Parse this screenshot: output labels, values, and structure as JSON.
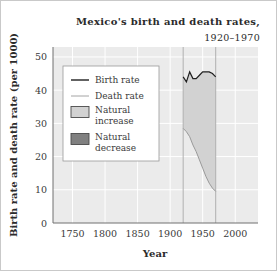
{
  "chart_data": {
    "type": "area",
    "title": "Mexico's birth and death rates,",
    "subtitle": "1920–1970",
    "xlabel": "Year",
    "ylabel": "Birth rate and death rate (per 1000)",
    "xlim": [
      1720,
      2035
    ],
    "ylim": [
      0,
      53
    ],
    "xticks": [
      1750,
      1800,
      1850,
      1900,
      1950,
      2000
    ],
    "yticks": [
      0,
      10,
      20,
      30,
      40,
      50
    ],
    "grid": "horizontal-and-vertical-light",
    "legend_position": "upper-left-inside",
    "legend": [
      {
        "label": "Birth rate",
        "marker": "line",
        "color": "#1f1f1f"
      },
      {
        "label": "Death rate",
        "marker": "line",
        "color": "#9a9a9a"
      },
      {
        "label": "Natural increase",
        "marker": "swatch",
        "color": "#d2d2d2"
      },
      {
        "label": "Natural decrease",
        "marker": "swatch",
        "color": "#808080"
      }
    ],
    "reference_lines": [
      {
        "x": 1920,
        "color": "#b0b0b0"
      },
      {
        "x": 1970,
        "color": "#b0b0b0"
      }
    ],
    "x": [
      1920,
      1925,
      1930,
      1935,
      1940,
      1945,
      1950,
      1955,
      1960,
      1965,
      1970
    ],
    "series": [
      {
        "name": "Birth rate",
        "color": "#1f1f1f",
        "values": [
          44.0,
          42.5,
          45.5,
          43.5,
          43.5,
          44.5,
          45.5,
          45.5,
          45.5,
          45.0,
          44.0
        ]
      },
      {
        "name": "Death rate",
        "color": "#9a9a9a",
        "values": [
          28.5,
          27.5,
          26.0,
          23.5,
          21.5,
          19.0,
          16.5,
          14.0,
          12.0,
          10.5,
          9.5
        ]
      }
    ],
    "fill_between": {
      "name": "Natural increase",
      "color": "#d2d2d2",
      "upper_series": "Birth rate",
      "lower_series": "Death rate"
    }
  }
}
